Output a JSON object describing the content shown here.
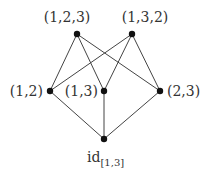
{
  "diagram": {
    "type": "hasse-diagram",
    "colors": {
      "edge": "#444444",
      "node": "#111111",
      "label": "#333333"
    },
    "nodes": [
      {
        "id": "n123",
        "label": "(1,2,3)",
        "x": 77,
        "y": 34
      },
      {
        "id": "n132",
        "label": "(1,3,2)",
        "x": 132,
        "y": 34
      },
      {
        "id": "n12",
        "label": "(1,2)",
        "x": 50,
        "y": 91
      },
      {
        "id": "n13",
        "label": "(1,3)",
        "x": 104,
        "y": 91
      },
      {
        "id": "n23",
        "label": "(2,3)",
        "x": 160,
        "y": 91
      },
      {
        "id": "nid",
        "label": "id",
        "label_subscript": "[1,3]",
        "x": 104,
        "y": 139
      }
    ],
    "edges": [
      [
        "n123",
        "n12"
      ],
      [
        "n123",
        "n13"
      ],
      [
        "n123",
        "n23"
      ],
      [
        "n132",
        "n12"
      ],
      [
        "n132",
        "n13"
      ],
      [
        "n132",
        "n23"
      ],
      [
        "n12",
        "nid"
      ],
      [
        "n13",
        "nid"
      ],
      [
        "n23",
        "nid"
      ]
    ]
  }
}
